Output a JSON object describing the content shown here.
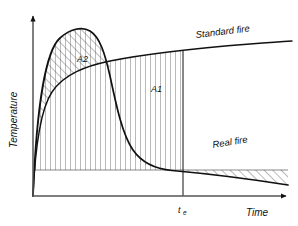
{
  "figure": {
    "title": "",
    "background": "#ffffff",
    "ink": "#111111",
    "hatch_color": "#3a3a3a"
  },
  "axes": {
    "y_label": "Temperature",
    "x_label": "Time",
    "origin": {
      "x": 33,
      "y": 196
    },
    "x_axis_end": {
      "x": 292,
      "y": 196
    },
    "y_axis_top": {
      "x": 33,
      "y": 13
    },
    "arrowheads": true,
    "ticks": [
      {
        "name": "te",
        "symbol": "t",
        "subscript": "e",
        "x": 183,
        "label_x": 180,
        "label_y": 211,
        "gridline": true,
        "gridline_from_y": 53,
        "gridline_to_y": 196
      }
    ]
  },
  "curves": [
    {
      "name": "standard-fire",
      "label": "Standard fire",
      "label_x": 196,
      "label_y": 38,
      "label_rotation": -7,
      "stroke": "#111111",
      "stroke_width": 1.4,
      "path": "M 33 196 C 35 150 40 110 52 92 C 64 74 86 66 110 61 C 140 55 200 48 250 44 C 268 42.5 282 41.5 292 41"
    },
    {
      "name": "real-fire",
      "label": "Real fire",
      "label_x": 213,
      "label_y": 148,
      "label_rotation": -9,
      "stroke": "#111111",
      "stroke_width": 1.6,
      "path": "M 33 196 C 36 120 44 52 60 38 C 70 29 82 26 90 31 C 100 37 105 54 110 76 C 116 104 122 134 133 150 C 142 163 156 169 172 170.5 C 200 173 250 179 288 185"
    }
  ],
  "regions": [
    {
      "name": "A2",
      "label": "A2",
      "label_x": 77,
      "label_y": 62,
      "hatch": "diagonal",
      "description": "Area between the real-fire curve and the standard-fire curve where the real fire exceeds the standard fire"
    },
    {
      "name": "A1",
      "label": "A1",
      "label_x": 151,
      "label_y": 92,
      "hatch": "vertical",
      "description": "Area between the standard-fire curve and the real-fire curve after the crossing point, up to te"
    },
    {
      "name": "under-real-fire-early",
      "label": "",
      "hatch": "cross",
      "description": "Cross-hatched area under the real-fire curve before the crossing point"
    },
    {
      "name": "under-real-fire-late",
      "label": "",
      "hatch": "diagonal",
      "description": "Diagonally hatched area under the real-fire curve to the right of te"
    }
  ],
  "baseline": {
    "name": "hatch-baseline",
    "y": 170,
    "x_from": 33,
    "x_to": 288
  }
}
